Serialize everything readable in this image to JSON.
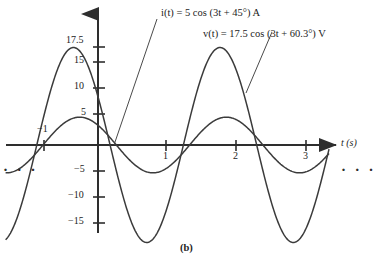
{
  "figure": {
    "caption": "(b)",
    "ellipsis_left": "· · ·",
    "ellipsis_right": "· · ·"
  },
  "annotations": {
    "current_label": "i(t) = 5 cos (3t + 45°)  A",
    "voltage_label": "v(t) = 17.5 cos (3t + 60.3°)  V"
  },
  "axes": {
    "x_axis_label": "t (s)",
    "x_ticks": [
      {
        "value": -1,
        "label": "−1"
      },
      {
        "value": 1,
        "label": "1"
      },
      {
        "value": 2,
        "label": "2"
      },
      {
        "value": 3,
        "label": "3"
      }
    ],
    "y_ticks": [
      {
        "value": 17.5,
        "label": "17.5"
      },
      {
        "value": 15,
        "label": "15"
      },
      {
        "value": 10,
        "label": "10"
      },
      {
        "value": 5,
        "label": "5"
      },
      {
        "value": -5,
        "label": "−5"
      },
      {
        "value": -10,
        "label": "−10"
      },
      {
        "value": -15,
        "label": "−15"
      }
    ]
  },
  "chart_data": {
    "type": "line",
    "title": "",
    "xlabel": "t (s)",
    "ylabel": "",
    "xlim": [
      -1.45,
      3.35
    ],
    "ylim": [
      -19,
      19.5
    ],
    "grid": false,
    "legend": "annotated-leader-lines",
    "x_ticks": [
      -1,
      1,
      2,
      3
    ],
    "y_ticks": [
      17.5,
      15,
      10,
      5,
      -5,
      -10,
      -15
    ],
    "series": [
      {
        "name": "v(t)",
        "expression": "v(t) = 17.5 cos (3t + 60.3°) V",
        "amplitude": 17.5,
        "angular_frequency": 3,
        "phase_deg": 60.3,
        "unit": "V",
        "color": "#3b3b3b"
      },
      {
        "name": "i(t)",
        "expression": "i(t) = 5 cos (3t + 45°) A",
        "amplitude": 5,
        "angular_frequency": 3,
        "phase_deg": 45,
        "unit": "A",
        "color": "#3b3b3b"
      }
    ]
  }
}
